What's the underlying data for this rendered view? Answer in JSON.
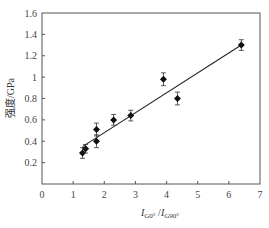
{
  "chart_data": {
    "type": "scatter",
    "title": "",
    "xlabel": "I_G0°/I_G90°",
    "xlabel_main1": "I",
    "xlabel_sub1": "G0°",
    "xlabel_sep": " /",
    "xlabel_main2": "I",
    "xlabel_sub2": "G90°",
    "ylabel": "强度/GPa",
    "xlim": [
      0,
      7
    ],
    "ylim": [
      0,
      1.6
    ],
    "xticks": [
      "0",
      "1",
      "2",
      "3",
      "4",
      "5",
      "6",
      "7"
    ],
    "yticks": [
      "0.2",
      "0.4",
      "0.6",
      "0.8",
      "1",
      "1.2",
      "1.4",
      "1.6"
    ],
    "grid": false,
    "legend": null,
    "points": [
      {
        "x": 1.3,
        "y": 0.29,
        "err": 0.05
      },
      {
        "x": 1.4,
        "y": 0.33,
        "err": 0.04
      },
      {
        "x": 1.75,
        "y": 0.51,
        "err": 0.06
      },
      {
        "x": 1.75,
        "y": 0.4,
        "err": 0.06
      },
      {
        "x": 2.3,
        "y": 0.6,
        "err": 0.05
      },
      {
        "x": 2.85,
        "y": 0.64,
        "err": 0.05
      },
      {
        "x": 3.9,
        "y": 0.98,
        "err": 0.06
      },
      {
        "x": 4.35,
        "y": 0.8,
        "err": 0.06
      },
      {
        "x": 6.4,
        "y": 1.3,
        "err": 0.05
      }
    ],
    "fit_line": {
      "x1": 1.3,
      "y1": 0.35,
      "x2": 6.4,
      "y2": 1.3
    }
  }
}
